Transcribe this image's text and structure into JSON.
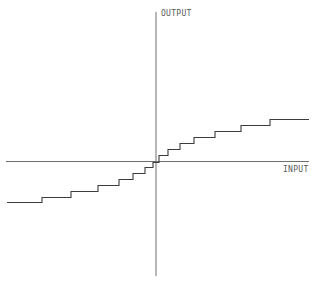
{
  "diagram": {
    "labels": {
      "y_axis": "OUTPUT",
      "x_axis": "INPUT"
    },
    "axes": {
      "horizontal": {
        "x1": 6,
        "y1": 161.5,
        "x2": 309,
        "y2": 161.5
      },
      "vertical": {
        "x1": 156,
        "y1": 12,
        "x2": 156,
        "y2": 276
      }
    },
    "label_positions": {
      "y_axis": {
        "x": 161,
        "y": 16
      },
      "x_axis": {
        "x": 283,
        "y": 172
      }
    },
    "staircase_points": [
      [
        7,
        202.5
      ],
      [
        42,
        202.5
      ],
      [
        42,
        197.5
      ],
      [
        71,
        197.5
      ],
      [
        71,
        191.5
      ],
      [
        98,
        191.5
      ],
      [
        98,
        185.5
      ],
      [
        119,
        185.5
      ],
      [
        119,
        179.5
      ],
      [
        133,
        179.5
      ],
      [
        133,
        173.5
      ],
      [
        145,
        173.5
      ],
      [
        145,
        167.5
      ],
      [
        153,
        167.5
      ],
      [
        153,
        162.5
      ],
      [
        159,
        162.5
      ],
      [
        159,
        155.5
      ],
      [
        168,
        155.5
      ],
      [
        168,
        149.5
      ],
      [
        180,
        149.5
      ],
      [
        180,
        143.5
      ],
      [
        194,
        143.5
      ],
      [
        194,
        137.5
      ],
      [
        215,
        137.5
      ],
      [
        215,
        131.5
      ],
      [
        241,
        131.5
      ],
      [
        241,
        125.5
      ],
      [
        270,
        125.5
      ],
      [
        270,
        119.5
      ],
      [
        309,
        119.5
      ]
    ],
    "colors": {
      "axis": "#6e6e6e",
      "curve": "#3c3c3c",
      "label": "#5a5a5a",
      "background": "#ffffff"
    }
  }
}
